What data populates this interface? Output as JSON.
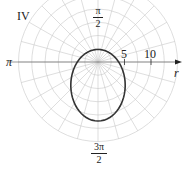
{
  "chart_data": {
    "type": "polar",
    "title": "",
    "quadrant_label": "IV",
    "angle_labels": {
      "pi_over_2": {
        "num": "π",
        "den": "2"
      },
      "pi": "π",
      "three_pi_over_2": {
        "num": "3π",
        "den": "2"
      }
    },
    "r_axis": {
      "label": "r",
      "ticks": [
        5,
        10
      ]
    },
    "grid": {
      "ring_step": 2.5,
      "max_r": 15,
      "spoke_step_deg": 15
    },
    "curve": {
      "equation_form": "r = k/(1 + e sin θ)",
      "k": 3.9,
      "e": 0.65,
      "r_at_pi_over_2": 2.4,
      "r_at_3pi_over_2": 11.1,
      "color": "#333333"
    },
    "colors": {
      "grid": "#c8c8c8",
      "axis": "#333333"
    }
  },
  "labels": {
    "quadrant": "IV",
    "top_num": "π",
    "top_den": "2",
    "left": "π",
    "bottom_num": "3π",
    "bottom_den": "2",
    "tick5": "5",
    "tick10": "10",
    "r": "r"
  }
}
